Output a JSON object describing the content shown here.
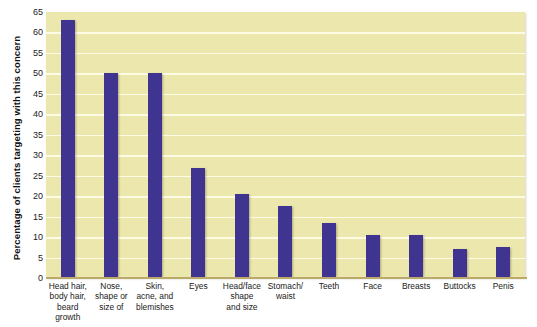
{
  "chart_data": {
    "type": "bar",
    "title": "",
    "subtitle": "",
    "xlabel": "",
    "ylabel": "Percentage of clients targeting with this concern",
    "ylim": [
      0,
      65
    ],
    "ytick_step": 5,
    "yticks": [
      "65",
      "60",
      "55",
      "50",
      "45",
      "40",
      "35",
      "30",
      "25",
      "20",
      "15",
      "10",
      "5",
      "0"
    ],
    "grid": true,
    "legend": "none",
    "bar_color": "#3f3490",
    "plot_background": "#ece7ad",
    "gridline_color": "#fdfbe4",
    "axis_line_color": "#b9a96a",
    "page_background": "#ffffff",
    "categories": [
      "Head hair, body hair, beard growth",
      "Nose, shape or size of",
      "Skin, acne, and blemishes",
      "Eyes",
      "Head/face shape and size",
      "Stomach/ waist",
      "Teeth",
      "Face",
      "Breasts",
      "Buttocks",
      "Penis"
    ],
    "category_lines": [
      [
        "Head hair,",
        "body hair,",
        "beard",
        "growth"
      ],
      [
        "Nose,",
        "shape or",
        "size of"
      ],
      [
        "Skin,",
        "acne, and",
        "blemishes"
      ],
      [
        "Eyes"
      ],
      [
        "Head/face",
        "shape",
        "and size"
      ],
      [
        "Stomach/",
        "waist"
      ],
      [
        "Teeth"
      ],
      [
        "Face"
      ],
      [
        "Breasts"
      ],
      [
        "Buttocks"
      ],
      [
        "Penis"
      ]
    ],
    "values": [
      63,
      50,
      50,
      27,
      20.5,
      17.5,
      13.5,
      10.5,
      10.5,
      7,
      7.5
    ]
  }
}
